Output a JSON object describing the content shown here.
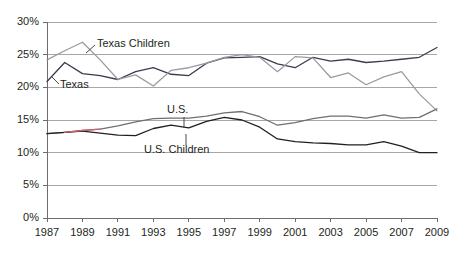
{
  "chart_data": {
    "type": "line",
    "title": "",
    "xlabel": "",
    "ylabel": "",
    "ylim": [
      0,
      30
    ],
    "xlim": [
      1987,
      2009
    ],
    "grid": true,
    "legend_position": "inline-annotations",
    "y_tick_labels": [
      "0%",
      "5%",
      "10%",
      "15%",
      "20%",
      "25%",
      "30%"
    ],
    "y_tick_values": [
      0,
      5,
      10,
      15,
      20,
      25,
      30
    ],
    "x_tick_labels": [
      "1987",
      "1989",
      "1991",
      "1993",
      "1995",
      "1997",
      "1999",
      "2001",
      "2003",
      "2005",
      "2007",
      "2009"
    ],
    "x_tick_values": [
      1987,
      1989,
      1991,
      1993,
      1995,
      1997,
      1999,
      2001,
      2003,
      2005,
      2007,
      2009
    ],
    "x": [
      1987,
      1988,
      1989,
      1990,
      1991,
      1992,
      1993,
      1994,
      1995,
      1996,
      1997,
      1998,
      1999,
      2000,
      2001,
      2002,
      2003,
      2004,
      2005,
      2006,
      2007,
      2008,
      2009
    ],
    "series": [
      {
        "name": "Texas",
        "color": "#3b3b4f",
        "values": [
          20.9,
          23.8,
          22.1,
          21.8,
          21.2,
          22.4,
          23.0,
          22.0,
          21.8,
          23.7,
          24.5,
          24.6,
          24.7,
          23.6,
          23.0,
          24.6,
          24.0,
          24.3,
          23.8,
          24.0,
          24.3,
          24.6,
          26.1
        ]
      },
      {
        "name": "Texas Children",
        "color": "#9a9aa2",
        "values": [
          24.2,
          25.6,
          26.9,
          24.2,
          21.2,
          21.9,
          20.2,
          22.6,
          23.0,
          23.7,
          24.6,
          25.0,
          24.6,
          22.4,
          24.7,
          24.5,
          21.5,
          22.2,
          20.4,
          21.6,
          22.4,
          19.0,
          16.4
        ]
      },
      {
        "name": "U.S.",
        "color": "#6f6f74",
        "values": [
          12.9,
          13.1,
          13.4,
          13.6,
          14.1,
          14.7,
          15.2,
          15.3,
          15.3,
          15.6,
          16.1,
          16.3,
          15.5,
          14.2,
          14.6,
          15.2,
          15.6,
          15.6,
          15.3,
          15.8,
          15.3,
          15.4,
          16.7
        ]
      },
      {
        "name": "U.S. Children",
        "color": "#231f20",
        "values": [
          12.9,
          13.1,
          13.3,
          13.0,
          12.7,
          12.6,
          13.7,
          14.2,
          13.8,
          14.8,
          15.4,
          15.0,
          13.9,
          12.1,
          11.7,
          11.5,
          11.4,
          11.2,
          11.2,
          11.7,
          11.0,
          10.0,
          10.0
        ]
      }
    ],
    "annotations": [
      {
        "text": "Texas Children",
        "series": "Texas Children"
      },
      {
        "text": "Texas",
        "series": "Texas"
      },
      {
        "text": "U.S.",
        "series": "U.S."
      },
      {
        "text": "U.S. Children",
        "series": "U.S. Children"
      }
    ],
    "highlight_segment_color": "#c9636b"
  }
}
